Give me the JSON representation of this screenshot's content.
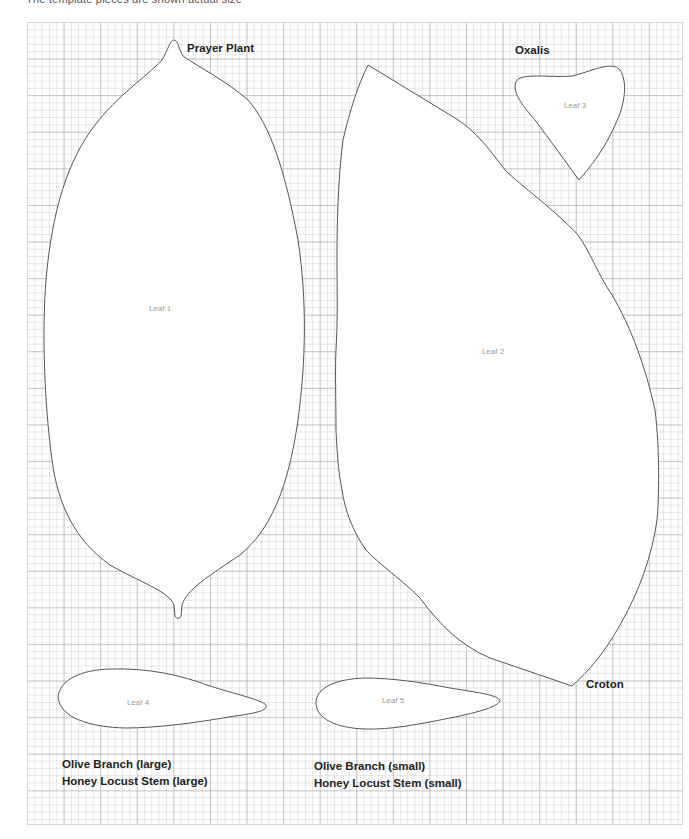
{
  "header": {
    "note": "The template pieces are shown actual size"
  },
  "leaves": [
    {
      "id": "leaf-1",
      "label": "Leaf 1",
      "plant": "Prayer Plant"
    },
    {
      "id": "leaf-2",
      "label": "Leaf 2",
      "plant": "Croton"
    },
    {
      "id": "leaf-3",
      "label": "Leaf 3",
      "plant": "Oxalis"
    },
    {
      "id": "leaf-4",
      "label": "Leaf 4",
      "plant_lines": [
        "Olive Branch (large)",
        "Honey Locust Stem (large)"
      ]
    },
    {
      "id": "leaf-5",
      "label": "Leaf 5",
      "plant_lines": [
        "Olive Branch (small)",
        "Honey Locust Stem (small)"
      ]
    }
  ],
  "colors": {
    "grid_major": "#aaaaaa",
    "grid_minor": "#c8c8c8",
    "outline": "#555555",
    "label_text": "#222222",
    "leaf_label_text": "#9a9a9a"
  }
}
